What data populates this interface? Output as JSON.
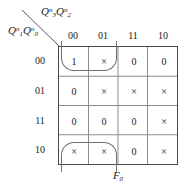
{
  "figure": {
    "type": "karnaugh-map",
    "function_name": "F",
    "function_subscript": "0",
    "column_variables": {
      "base_1": "Q",
      "sub_1": "3",
      "sup_1": "n",
      "base_2": "Q",
      "sub_2": "2",
      "sup_2": "n"
    },
    "row_variables": {
      "base_1": "Q",
      "sub_1": "1",
      "sup_1": "n",
      "base_2": "Q",
      "sub_2": "0",
      "sup_2": "n"
    },
    "column_headers": [
      "00",
      "01",
      "11",
      "10"
    ],
    "row_headers": [
      "00",
      "01",
      "11",
      "10"
    ],
    "cells": [
      [
        "1",
        "×",
        "0",
        "0"
      ],
      [
        "0",
        "×",
        "×",
        "×"
      ],
      [
        "0",
        "0",
        "0",
        "×"
      ],
      [
        "×",
        "×",
        "0",
        "×"
      ]
    ],
    "groups": [
      {
        "label": "top-group",
        "row": "00",
        "columns": [
          "00",
          "01"
        ]
      },
      {
        "label": "bottom-group",
        "row": "10",
        "columns": [
          "00",
          "01"
        ]
      }
    ],
    "colors": {
      "grid_border": "#4a4a4a",
      "grid_lines": "#8a8a8a",
      "loop": "#6e6e6e",
      "text": "#1a1a1a",
      "background": "#ffffff"
    }
  }
}
